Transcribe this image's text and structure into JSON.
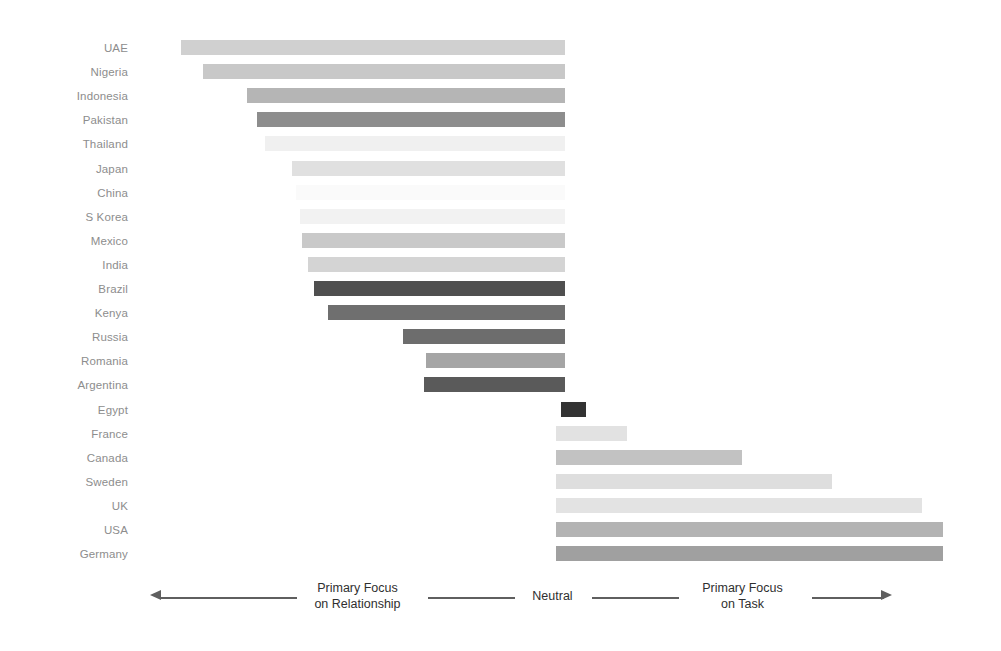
{
  "chart_data": {
    "type": "bar",
    "title": "",
    "subtitle": "",
    "xlabel": "",
    "ylabel": "",
    "orientation": "horizontal",
    "diverging": true,
    "neutral_point": 0,
    "xlim": [
      -5.0,
      5.0
    ],
    "grid": false,
    "legend": "none",
    "axis_annotations": [
      {
        "text_line1": "Primary Focus",
        "text_line2": "on Relationship",
        "position": "left"
      },
      {
        "text_line1": "Neutral",
        "text_line2": "",
        "position": "center"
      },
      {
        "text_line1": "Primary Focus",
        "text_line2": "on Task",
        "position": "right"
      }
    ],
    "categories": [
      "UAE",
      "Nigeria",
      "Indonesia",
      "Pakistan",
      "Thailand",
      "Japan",
      "China",
      "S Korea",
      "Mexico",
      "India",
      "Brazil",
      "Kenya",
      "Russia",
      "Romania",
      "Argentina",
      "Egypt",
      "France",
      "Canada",
      "Sweden",
      "UK",
      "USA",
      "Germany"
    ],
    "values": [
      -4.02,
      -3.45,
      -3.11,
      -3.05,
      -2.8,
      -2.1,
      -2.05,
      -1.94,
      -2.66,
      -2.4,
      -2.27,
      -2.09,
      -1.2,
      -1.07,
      -1.1,
      0.3,
      0.75,
      2.19,
      3.32,
      4.46,
      4.72,
      4.72
    ],
    "bars": [
      {
        "label": "UAE",
        "value": -4.02,
        "start_px": 181,
        "end_px": 565,
        "color": "#d0d0d0"
      },
      {
        "label": "Nigeria",
        "value": -3.45,
        "start_px": 203,
        "end_px": 565,
        "color": "#c8c8c8"
      },
      {
        "label": "Indonesia",
        "value": -3.11,
        "start_px": 247,
        "end_px": 565,
        "color": "#b5b5b5"
      },
      {
        "label": "Pakistan",
        "value": -3.05,
        "start_px": 257,
        "end_px": 565,
        "color": "#8d8d8d"
      },
      {
        "label": "Thailand",
        "value": -2.8,
        "start_px": 265,
        "end_px": 565,
        "color": "#f0f0f0"
      },
      {
        "label": "Japan",
        "value": -2.1,
        "start_px": 292,
        "end_px": 565,
        "color": "#e0e0e0"
      },
      {
        "label": "China",
        "value": -2.05,
        "start_px": 296,
        "end_px": 565,
        "color": "#fafafa"
      },
      {
        "label": "S Korea",
        "value": -1.94,
        "start_px": 300,
        "end_px": 565,
        "color": "#f2f2f2"
      },
      {
        "label": "Mexico",
        "value": -2.66,
        "start_px": 302,
        "end_px": 565,
        "color": "#c9c9c9"
      },
      {
        "label": "India",
        "value": -2.4,
        "start_px": 308,
        "end_px": 565,
        "color": "#d4d4d4"
      },
      {
        "label": "Brazil",
        "value": -2.27,
        "start_px": 314,
        "end_px": 565,
        "color": "#4f4f4f"
      },
      {
        "label": "Kenya",
        "value": -2.09,
        "start_px": 328,
        "end_px": 565,
        "color": "#6f6f6f"
      },
      {
        "label": "Russia",
        "value": -1.2,
        "start_px": 403,
        "end_px": 565,
        "color": "#6d6d6d"
      },
      {
        "label": "Romania",
        "value": -1.07,
        "start_px": 426,
        "end_px": 565,
        "color": "#a5a5a5"
      },
      {
        "label": "Argentina",
        "value": -1.1,
        "start_px": 424,
        "end_px": 565,
        "color": "#5a5a5a"
      },
      {
        "label": "Egypt",
        "value": 0.3,
        "start_px": 561,
        "end_px": 586,
        "color": "#333333"
      },
      {
        "label": "France",
        "value": 0.75,
        "start_px": 556,
        "end_px": 627,
        "color": "#e2e2e2"
      },
      {
        "label": "Canada",
        "value": 2.19,
        "start_px": 556,
        "end_px": 742,
        "color": "#c2c2c2"
      },
      {
        "label": "Sweden",
        "value": 3.32,
        "start_px": 556,
        "end_px": 832,
        "color": "#dedede"
      },
      {
        "label": "UK",
        "value": 4.46,
        "start_px": 556,
        "end_px": 922,
        "color": "#e3e3e3"
      },
      {
        "label": "USA",
        "value": 4.72,
        "start_px": 556,
        "end_px": 943,
        "color": "#b3b3b3"
      },
      {
        "label": "Germany",
        "value": 4.72,
        "start_px": 556,
        "end_px": 943,
        "color": "#a0a0a0"
      }
    ]
  },
  "axis": {
    "left_label_line1": "Primary Focus",
    "left_label_line2": "on Relationship",
    "center_label": "Neutral",
    "right_label_line1": "Primary Focus",
    "right_label_line2": "on Task"
  },
  "colors": {
    "background": "#ffffff",
    "label_text": "#8d8d8d",
    "axis_text": "#2f2f2f",
    "axis_line": "#5f5f5f"
  }
}
